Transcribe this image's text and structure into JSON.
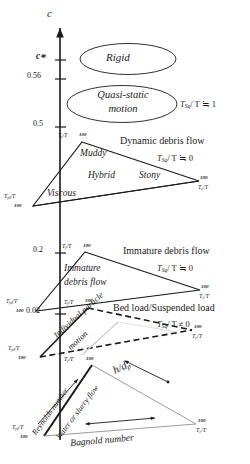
{
  "figure": {
    "type": "classification-diagram",
    "axis": {
      "name": "c",
      "label": "c",
      "description": "volumetric sediment concentration, vertical axis with upward arrow",
      "ticks": [
        {
          "value": "c*",
          "display": "c*",
          "y_px": 60
        },
        {
          "value": "0.56",
          "display": "0.56",
          "y_px": 79
        },
        {
          "value": "0.5",
          "display": "0.5",
          "y_px": 127
        },
        {
          "value": "0.2",
          "display": "0.2",
          "y_px": 253
        },
        {
          "value": "0.02",
          "display": "0.02",
          "y_px": 314
        }
      ]
    },
    "ellipses": [
      {
        "label": "Rigid",
        "cx": 128,
        "cy": 59,
        "rx": 48,
        "ry": 16
      },
      {
        "label": "Quasi-static motion",
        "line1": "Quasi-static",
        "line2": "motion",
        "cx": 122,
        "cy": 104,
        "rx": 55,
        "ry": 19
      }
    ],
    "bands": [
      {
        "id": "dynamic-debris-flow",
        "title": "Dynamic debris flow",
        "ratio": "T_sq / T ≒ 0",
        "ratio_sub": "Sq",
        "ratio_tail": "/ T ≒ 0",
        "regions": [
          "Muddy",
          "Hybrid",
          "Stony",
          "Viscous"
        ],
        "vertices": [
          {
            "name": "T_f/T",
            "sub": "f",
            "tail": "/T",
            "hundred": "100"
          },
          {
            "name": "T_c/T",
            "sub": "c",
            "tail": "/T",
            "hundred": "100"
          },
          {
            "name": "T_fd/T",
            "sub": "fd",
            "tail": "/T",
            "hundred": "100"
          }
        ]
      },
      {
        "id": "immature-debris-flow",
        "title": "Immature debris flow",
        "ratio": "T_sq / T ≒ 0",
        "ratio_sub": "Sq",
        "ratio_tail": "/ T ≒ 0",
        "regions": [
          "Immature debris flow"
        ],
        "vertices": [
          {
            "name": "T_f/T",
            "sub": "f",
            "tail": "/T",
            "hundred": "100"
          },
          {
            "name": "T_c/T",
            "sub": "c",
            "tail": "/T",
            "hundred": "100"
          },
          {
            "name": "T_fd/T",
            "sub": "fd",
            "tail": "/T",
            "hundred": "100"
          }
        ]
      },
      {
        "id": "bed-load-suspended-load",
        "title": "Bed load/Suspended load",
        "ratio": "T_sq / T ≠ 0",
        "ratio_sub": "Sq",
        "ratio_tail": "/ T ≠ 0",
        "regions": [
          "Individual particle motion"
        ],
        "vertices": [
          {
            "name": "T_f/T",
            "sub": "f",
            "tail": "/T",
            "hundred": "100"
          },
          {
            "name": "T_c/T",
            "sub": "c",
            "tail": "/T",
            "hundred": "100"
          },
          {
            "name": "T_fd/T",
            "sub": "fd",
            "tail": "/T",
            "hundred": "100"
          }
        ]
      },
      {
        "id": "water-or-slurry-flow",
        "title": "",
        "ratio": "",
        "regions": [
          "Water or slurry flow"
        ],
        "parameters": [
          "Reynolds number",
          "h/dp",
          "Bagnold number"
        ],
        "vertices": [
          {
            "name": "T_f/T",
            "sub": "f",
            "tail": "/T",
            "hundred": "100"
          },
          {
            "name": "T_c/T",
            "sub": "c",
            "tail": "/T",
            "hundred": "100"
          },
          {
            "name": "T_fd/T",
            "sub": "fd",
            "tail": "/T",
            "hundred": "100"
          }
        ]
      }
    ],
    "top_ratio": {
      "ratio": "T_sq / T ≒ 1",
      "sub": "Sq",
      "tail": "/ T ≒ 1"
    },
    "texts": {
      "axis_c": "c",
      "axis_cstar": "c",
      "axis_cstar_sub": "*",
      "tick_056": "0.56",
      "tick_05": "0.5",
      "tick_02": "0.2",
      "tick_002": "0.02",
      "rigid": "Rigid",
      "quasi_static_l1": "Quasi-static",
      "quasi_static_l2": "motion",
      "muddy": "Muddy",
      "hybrid": "Hybrid",
      "stony": "Stony",
      "viscous": "Viscous",
      "immature_l1": "Immature",
      "immature_l2": "debris flow",
      "individual_particle_l1": "Individual particle",
      "individual_particle_l2": "motion",
      "water_or_slurry": "Water or slurry flow",
      "reynolds_number": "Reynolds number",
      "bagnold_number": "Bagnold number",
      "h_over_dp": "h/d",
      "h_over_dp_sub": "p",
      "dynamic_debris_flow": "Dynamic debris flow",
      "immature_debris_flow": "Immature debris flow",
      "bed_load_suspended_load": "Bed load/Suspended load",
      "T": "T",
      "sub_sq": "Sq",
      "sub_f": "f",
      "sub_c": "c",
      "sub_fd": "fd",
      "slashT": "/T",
      "hundred": "100",
      "ratio_eq1": "/ T ≒ 1",
      "ratio_eq0": "/ T ≒ 0",
      "ratio_ne0": "/ T ≠ 0"
    },
    "colors": {
      "ink": "#1a1a1a",
      "line": "#2b2b2b",
      "faint": "#9a9a9a",
      "background": "#ffffff"
    }
  }
}
